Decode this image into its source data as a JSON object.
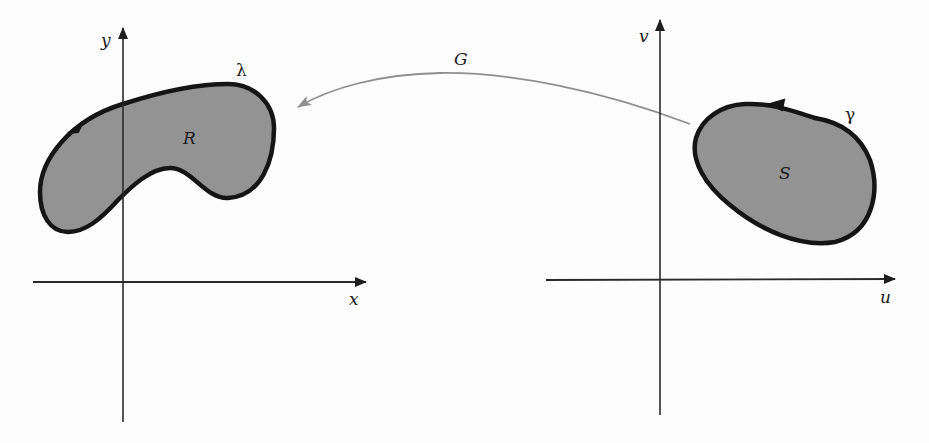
{
  "diagram": {
    "colors": {
      "background": "#fdfdfd",
      "axis": "#2a2a2a",
      "region_fill": "#939393",
      "region_stroke": "#151515",
      "mapping_arrow": "#8f8f8f",
      "text": "#1a1a1a"
    },
    "left_plane": {
      "x_axis_label": "x",
      "y_axis_label": "y",
      "region_label": "R",
      "boundary_label": "λ"
    },
    "right_plane": {
      "x_axis_label": "u",
      "y_axis_label": "v",
      "region_label": "S",
      "boundary_label": "γ"
    },
    "mapping": {
      "label": "G",
      "direction": "from S (uv-plane) to R (xy-plane)"
    }
  }
}
